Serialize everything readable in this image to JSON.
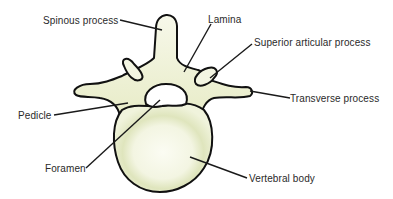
{
  "diagram": {
    "colors": {
      "bone_fill": "#f3f5e2",
      "bone_shade": "#d9e0b4",
      "outline": "#111111",
      "leader": "#1a1a1a",
      "text": "#2a2a2a",
      "background": "#ffffff"
    },
    "labels": {
      "spinous_process": "Spinous process",
      "lamina": "Lamina",
      "superior_articular_process": "Superior articular process",
      "transverse_process": "Transverse process",
      "pedicle": "Pedicle",
      "foramen": "Foramen",
      "vertebral_body": "Vertebral body"
    }
  }
}
